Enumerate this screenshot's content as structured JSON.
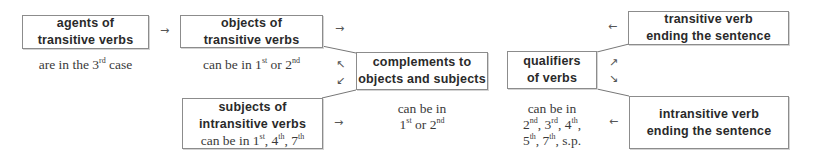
{
  "nodes": {
    "agents": {
      "title_line1": "agents of",
      "title_line2": "transitive verbs",
      "note": {
        "prefix": "are in the 3",
        "sup": "rd",
        "suffix": " case"
      }
    },
    "objects": {
      "title_line1": "objects of",
      "title_line2": "transitive verbs",
      "note": {
        "prefix": "can be in 1",
        "sup1": "st",
        "mid": " or 2",
        "sup2": "nd"
      }
    },
    "complements": {
      "title_line1": "complements to",
      "title_line2": "objects and subjects",
      "note": {
        "line1": "can be in",
        "p1": "1",
        "sup1": "st",
        "mid": " or 2",
        "sup2": "nd"
      }
    },
    "subjects": {
      "title_line1": "subjects of",
      "title_line2": "intransitive verbs",
      "note": {
        "prefix": "can be in 1",
        "sup1": "st",
        "sep1": ", 4",
        "sup2": "th",
        "sep2": ", 7",
        "sup3": "th"
      }
    },
    "qualifiers": {
      "title_line1": "qualifiers",
      "title_line2": "of verbs",
      "note": {
        "line1": "can be in",
        "a": "2",
        "a_sup": "nd",
        "b": ", 3",
        "b_sup": "rd",
        "c": ", 4",
        "c_sup": "th",
        "c_end": ",",
        "d": "5",
        "d_sup": "th",
        "e": ", 7",
        "e_sup": "th",
        "f": ", s.p."
      }
    },
    "transitive_end": {
      "title_line1": "transitive verb",
      "title_line2": "ending the sentence"
    },
    "intransitive_end": {
      "title_line1": "intransitive verb",
      "title_line2": "ending the sentence"
    }
  },
  "arrows": {
    "agents_to_objects": "→",
    "objects_right": "→",
    "complements_to_objects": "↖",
    "complements_to_subjects": "↙",
    "subjects_to_complements": "→",
    "transitive_end_left": "←",
    "qualifiers_up": "↗",
    "qualifiers_down": "↘",
    "intransitive_end_left": "←"
  }
}
